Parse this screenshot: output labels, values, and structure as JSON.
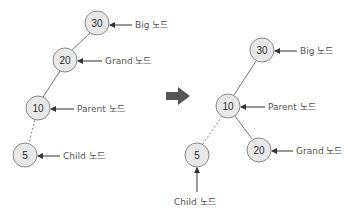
{
  "colors": {
    "node_fill": "#e8e8e8",
    "node_stroke": "#8a8a8a",
    "transform_arrow": "#555555",
    "text": "#555555"
  },
  "before": {
    "nodes": [
      {
        "id": "big",
        "value": "30",
        "label": "Big 노드"
      },
      {
        "id": "grand",
        "value": "20",
        "label": "Grand 노드"
      },
      {
        "id": "parent",
        "value": "10",
        "label": "Parent 노드"
      },
      {
        "id": "child",
        "value": "5",
        "label": "Child 노드"
      }
    ]
  },
  "transform_arrow": {
    "icon": "right-arrow-icon"
  },
  "after": {
    "nodes": [
      {
        "id": "big",
        "value": "30",
        "label": "Big 노드"
      },
      {
        "id": "parent",
        "value": "10",
        "label": "Parent 노드"
      },
      {
        "id": "child",
        "value": "5",
        "label": "Child 노드"
      },
      {
        "id": "grand",
        "value": "20",
        "label": "Grand 노드"
      }
    ]
  }
}
